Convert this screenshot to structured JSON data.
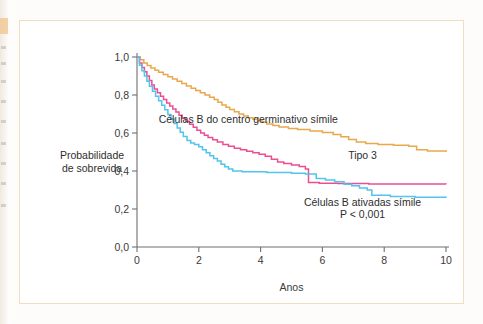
{
  "figure": {
    "y_axis_label_line1": "Probabilidade",
    "y_axis_label_line2": "de sobrevida"
  },
  "colors": {
    "germinal_center": "#e8a84e",
    "type3": "#ec4e93",
    "activated_b": "#52c4ed",
    "axis": "#6f6f6f",
    "text": "#2e2e2e",
    "frame": "#f2dcc2"
  },
  "chart_data": {
    "type": "line",
    "title": "",
    "subtitle": "",
    "xlabel": "Anos",
    "ylabel": "Probabilidade de sobrevida",
    "xlim": [
      0,
      10
    ],
    "ylim": [
      0,
      1
    ],
    "xticks": [
      0,
      2,
      4,
      6,
      8,
      10
    ],
    "xticklabels": [
      "0",
      "2",
      "4",
      "6",
      "8",
      "10"
    ],
    "yticks": [
      0.0,
      0.2,
      0.4,
      0.6,
      0.8,
      1.0
    ],
    "yticklabels": [
      "0,0",
      "0,2",
      "0,4",
      "0,6",
      "0,8",
      "1,0"
    ],
    "grid": false,
    "legend_position": "inline-annotations",
    "step_style": "post",
    "annotations": [
      {
        "text": "Células B do centro germinativo símile",
        "x": 3.6,
        "y": 0.655
      },
      {
        "text": "Tipo 3",
        "x": 7.3,
        "y": 0.465
      },
      {
        "text": "Células B ativadas símile",
        "x": 7.3,
        "y": 0.215
      },
      {
        "text": "P < 0,001",
        "x": 7.3,
        "y": 0.155
      }
    ],
    "series": [
      {
        "name": "Células B do centro germinativo símile",
        "color": "#e8a84e",
        "points": [
          [
            0.0,
            1.0
          ],
          [
            0.1,
            0.985
          ],
          [
            0.22,
            0.968
          ],
          [
            0.33,
            0.955
          ],
          [
            0.45,
            0.942
          ],
          [
            0.58,
            0.93
          ],
          [
            0.7,
            0.92
          ],
          [
            0.85,
            0.908
          ],
          [
            1.0,
            0.896
          ],
          [
            1.15,
            0.884
          ],
          [
            1.3,
            0.872
          ],
          [
            1.45,
            0.861
          ],
          [
            1.6,
            0.848
          ],
          [
            1.75,
            0.836
          ],
          [
            1.9,
            0.824
          ],
          [
            2.05,
            0.812
          ],
          [
            2.2,
            0.8
          ],
          [
            2.35,
            0.788
          ],
          [
            2.5,
            0.776
          ],
          [
            2.62,
            0.762
          ],
          [
            2.75,
            0.748
          ],
          [
            2.88,
            0.736
          ],
          [
            3.0,
            0.724
          ],
          [
            3.15,
            0.712
          ],
          [
            3.3,
            0.7
          ],
          [
            3.45,
            0.69
          ],
          [
            3.6,
            0.68
          ],
          [
            3.75,
            0.672
          ],
          [
            3.9,
            0.664
          ],
          [
            4.05,
            0.656
          ],
          [
            4.2,
            0.648
          ],
          [
            4.4,
            0.64
          ],
          [
            4.6,
            0.632
          ],
          [
            4.9,
            0.624
          ],
          [
            5.2,
            0.618
          ],
          [
            5.6,
            0.61
          ],
          [
            6.0,
            0.602
          ],
          [
            6.35,
            0.592
          ],
          [
            6.6,
            0.58
          ],
          [
            6.85,
            0.566
          ],
          [
            7.1,
            0.552
          ],
          [
            7.4,
            0.545
          ],
          [
            7.8,
            0.54
          ],
          [
            8.3,
            0.535
          ],
          [
            8.8,
            0.53
          ],
          [
            9.05,
            0.512
          ],
          [
            9.4,
            0.505
          ],
          [
            10.0,
            0.5
          ]
        ]
      },
      {
        "name": "Tipo 3",
        "color": "#ec4e93",
        "points": [
          [
            0.0,
            1.0
          ],
          [
            0.08,
            0.968
          ],
          [
            0.16,
            0.945
          ],
          [
            0.24,
            0.922
          ],
          [
            0.32,
            0.9
          ],
          [
            0.4,
            0.876
          ],
          [
            0.48,
            0.852
          ],
          [
            0.56,
            0.832
          ],
          [
            0.66,
            0.812
          ],
          [
            0.76,
            0.794
          ],
          [
            0.86,
            0.776
          ],
          [
            0.96,
            0.758
          ],
          [
            1.06,
            0.742
          ],
          [
            1.16,
            0.726
          ],
          [
            1.26,
            0.71
          ],
          [
            1.36,
            0.694
          ],
          [
            1.46,
            0.678
          ],
          [
            1.58,
            0.662
          ],
          [
            1.7,
            0.646
          ],
          [
            1.82,
            0.63
          ],
          [
            1.94,
            0.614
          ],
          [
            2.06,
            0.6
          ],
          [
            2.18,
            0.588
          ],
          [
            2.3,
            0.576
          ],
          [
            2.45,
            0.564
          ],
          [
            2.6,
            0.552
          ],
          [
            2.78,
            0.54
          ],
          [
            2.96,
            0.53
          ],
          [
            3.15,
            0.52
          ],
          [
            3.35,
            0.512
          ],
          [
            3.55,
            0.504
          ],
          [
            3.75,
            0.496
          ],
          [
            3.95,
            0.488
          ],
          [
            4.15,
            0.478
          ],
          [
            4.35,
            0.462
          ],
          [
            4.55,
            0.448
          ],
          [
            4.75,
            0.44
          ],
          [
            5.0,
            0.432
          ],
          [
            5.25,
            0.424
          ],
          [
            5.45,
            0.41
          ],
          [
            5.55,
            0.34
          ],
          [
            5.9,
            0.336
          ],
          [
            6.5,
            0.334
          ],
          [
            7.5,
            0.332
          ],
          [
            8.5,
            0.331
          ],
          [
            10.0,
            0.33
          ]
        ]
      },
      {
        "name": "Células B ativadas símile",
        "color": "#52c4ed",
        "points": [
          [
            0.0,
            1.0
          ],
          [
            0.08,
            0.956
          ],
          [
            0.16,
            0.928
          ],
          [
            0.24,
            0.9
          ],
          [
            0.32,
            0.872
          ],
          [
            0.4,
            0.846
          ],
          [
            0.5,
            0.82
          ],
          [
            0.6,
            0.794
          ],
          [
            0.7,
            0.77
          ],
          [
            0.8,
            0.746
          ],
          [
            0.9,
            0.722
          ],
          [
            1.0,
            0.698
          ],
          [
            1.1,
            0.674
          ],
          [
            1.2,
            0.65
          ],
          [
            1.3,
            0.626
          ],
          [
            1.4,
            0.604
          ],
          [
            1.5,
            0.582
          ],
          [
            1.62,
            0.56
          ],
          [
            1.74,
            0.548
          ],
          [
            1.86,
            0.54
          ],
          [
            2.0,
            0.528
          ],
          [
            2.12,
            0.512
          ],
          [
            2.24,
            0.496
          ],
          [
            2.36,
            0.48
          ],
          [
            2.48,
            0.466
          ],
          [
            2.6,
            0.452
          ],
          [
            2.72,
            0.436
          ],
          [
            2.84,
            0.422
          ],
          [
            2.96,
            0.41
          ],
          [
            3.1,
            0.4
          ],
          [
            3.4,
            0.396
          ],
          [
            4.2,
            0.392
          ],
          [
            5.0,
            0.388
          ],
          [
            5.45,
            0.384
          ],
          [
            5.8,
            0.36
          ],
          [
            6.1,
            0.352
          ],
          [
            6.4,
            0.344
          ],
          [
            6.7,
            0.33
          ],
          [
            6.95,
            0.322
          ],
          [
            7.2,
            0.31
          ],
          [
            7.45,
            0.3
          ],
          [
            7.6,
            0.272
          ],
          [
            8.2,
            0.266
          ],
          [
            9.0,
            0.262
          ],
          [
            10.0,
            0.258
          ]
        ]
      }
    ]
  }
}
